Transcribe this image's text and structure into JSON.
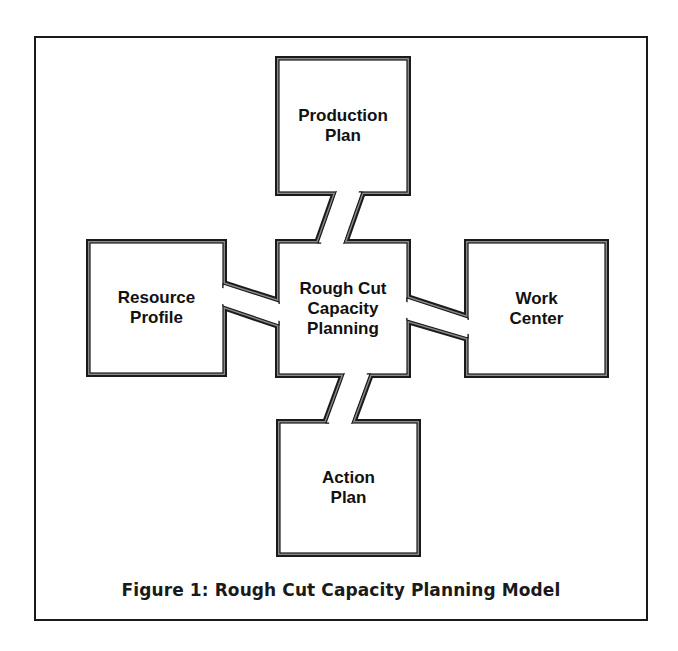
{
  "figure": {
    "caption": "Figure 1: Rough Cut Capacity Planning Model",
    "colors": {
      "border": "#1a1a1a",
      "background": "#ffffff",
      "text": "#111111"
    }
  },
  "nodes": {
    "center": {
      "line1": "Rough Cut",
      "line2": "Capacity",
      "line3": "Planning"
    },
    "top": {
      "line1": "Production",
      "line2": "Plan"
    },
    "left": {
      "line1": "Resource",
      "line2": "Profile"
    },
    "right": {
      "line1": "Work",
      "line2": "Center"
    },
    "bottom": {
      "line1": "Action",
      "line2": "Plan"
    }
  },
  "connections": [
    {
      "from": "Production Plan",
      "to": "Rough Cut Capacity Planning"
    },
    {
      "from": "Resource Profile",
      "to": "Rough Cut Capacity Planning"
    },
    {
      "from": "Work Center",
      "to": "Rough Cut Capacity Planning"
    },
    {
      "from": "Action Plan",
      "to": "Rough Cut Capacity Planning"
    }
  ]
}
